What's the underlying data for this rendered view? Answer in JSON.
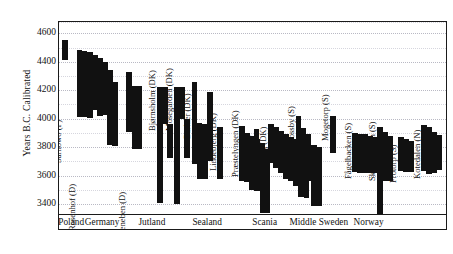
{
  "chart_data": {
    "type": "bar",
    "title": "",
    "xlabel": "",
    "ylabel": "Years B.C. Calibrated",
    "ylim": [
      3330,
      4680
    ],
    "yticks": [
      4600,
      4400,
      4200,
      4000,
      3800,
      3600,
      3400
    ],
    "grid": true,
    "legend": null,
    "orientation": "vertical-range-bars",
    "note": "Each site is a cluster of adjacent vertical bars; every bar spans a calibrated radiocarbon date range (high = older).",
    "categories": [
      "Poland",
      "Germany",
      "Jutland",
      "Sealand",
      "Scania",
      "Middle Sweden",
      "Norway"
    ],
    "series": [
      {
        "name": "Sarnowo (P)",
        "region": "Poland",
        "ranges": [
          [
            4410,
            4555
          ]
        ]
      },
      {
        "name": "Rosenhof (D)",
        "region": "Germany",
        "ranges": [
          [
            4010,
            4480
          ],
          [
            4010,
            4475
          ],
          [
            4005,
            4470
          ],
          [
            4060,
            4450
          ],
          [
            4020,
            4425
          ],
          [
            4025,
            4400
          ],
          [
            3815,
            4345
          ],
          [
            3810,
            4260
          ]
        ]
      },
      {
        "name": "Siggeneben (D)",
        "region": "Germany",
        "ranges": [
          [
            3905,
            4330
          ],
          [
            3790,
            4230
          ],
          [
            3790,
            4230
          ]
        ]
      },
      {
        "name": "Bjørnsholm (DK)",
        "region": "Jutland",
        "ranges": [
          [
            3405,
            4225
          ],
          [
            3965,
            4225
          ],
          [
            3725,
            3965
          ]
        ]
      },
      {
        "name": "Mosegården (DK)",
        "region": "Jutland",
        "ranges": [
          [
            3400,
            4225
          ],
          [
            3995,
            4225
          ],
          [
            3725,
            3995
          ]
        ]
      },
      {
        "name": "Barkær (DK)",
        "region": "Jutland",
        "ranges": [
          [
            3680,
            4260
          ],
          [
            3575,
            3970
          ],
          [
            3575,
            3965
          ],
          [
            3705,
            4185
          ]
        ]
      },
      {
        "name": "Lindebjerg (DK)",
        "region": "Sealand",
        "ranges": [
          [
            3575,
            3940
          ]
        ]
      },
      {
        "name": "Præstelyngen (DK)",
        "region": "Sealand",
        "ranges": [
          [
            3560,
            3950
          ],
          [
            3555,
            3900
          ],
          [
            3500,
            3880
          ],
          [
            3495,
            3855
          ],
          [
            3335,
            3830
          ],
          [
            3335,
            3790
          ]
        ]
      },
      {
        "name": "Øgårde (DK)",
        "region": "Sealand",
        "ranges": [
          [
            3600,
            3930
          ]
        ]
      },
      {
        "name": "Muldbjerg (DK)",
        "region": "Sealand",
        "ranges": [
          [
            3690,
            3965
          ],
          [
            3655,
            3945
          ],
          [
            3615,
            3915
          ],
          [
            3575,
            3895
          ],
          [
            3560,
            3870
          ],
          [
            3530,
            3860
          ],
          [
            3450,
            3840
          ],
          [
            3445,
            3800
          ]
        ]
      },
      {
        "name": "Mossby (S)",
        "region": "Scania",
        "ranges": [
          [
            3575,
            4020
          ],
          [
            3720,
            3935
          ],
          [
            3560,
            3895
          ],
          [
            3385,
            3815
          ],
          [
            3385,
            3800
          ]
        ]
      },
      {
        "name": "Mogetorp (S)",
        "region": "Scania",
        "ranges": [
          [
            3760,
            4020
          ]
        ]
      },
      {
        "name": "Fågelbacken (S)",
        "region": "Middle Sweden",
        "ranges": [
          [
            3625,
            3900
          ],
          [
            3620,
            3895
          ],
          [
            3620,
            3890
          ],
          [
            3615,
            3880
          ],
          [
            3620,
            3870
          ]
        ]
      },
      {
        "name": "Skogsmossen (S)",
        "region": "Middle Sweden",
        "ranges": [
          [
            3330,
            3940
          ],
          [
            3565,
            3905
          ],
          [
            3560,
            3880
          ]
        ]
      },
      {
        "name": "Frotorp (S)",
        "region": "Middle Sweden",
        "ranges": [
          [
            3630,
            3870
          ],
          [
            3625,
            3860
          ],
          [
            3625,
            3840
          ]
        ]
      },
      {
        "name": "Kotedalen (N)",
        "region": "Norway",
        "ranges": [
          [
            3630,
            3955
          ],
          [
            3610,
            3940
          ],
          [
            3620,
            3905
          ],
          [
            3640,
            3885
          ]
        ]
      }
    ]
  },
  "axis": {
    "y_title": "Years B.C. Calibrated",
    "tick_labels": [
      "4600",
      "4400",
      "4200",
      "4000",
      "3800",
      "3600",
      "3400"
    ]
  },
  "categories": [
    {
      "label": "Poland"
    },
    {
      "label": "Germany"
    },
    {
      "label": "Jutland"
    },
    {
      "label": "Sealand"
    },
    {
      "label": "Scania"
    },
    {
      "label": "Middle Sweden"
    },
    {
      "label": "Norway"
    }
  ]
}
